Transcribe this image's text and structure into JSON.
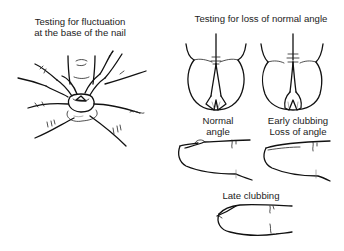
{
  "figure": {
    "panels": [
      {
        "id": "fluctuation",
        "caption_lines": [
          "Testing for fluctuation",
          "at the base of the nail"
        ],
        "signature": "Myers"
      },
      {
        "id": "angle",
        "caption_lines": [
          "Testing for loss of normal angle"
        ],
        "subfigures": [
          {
            "id": "normal",
            "caption_lines": [
              "Normal",
              "angle"
            ]
          },
          {
            "id": "early",
            "caption_lines": [
              "Early clubbing",
              "Loss of angle"
            ]
          }
        ]
      },
      {
        "id": "late",
        "caption_lines": [
          "Late clubbing"
        ]
      }
    ]
  }
}
